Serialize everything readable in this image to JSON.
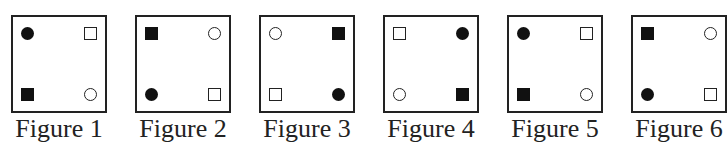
{
  "figures": [
    {
      "label": "Figure 1",
      "tl": "filled-circle",
      "tr": "open-square",
      "bl": "filled-square",
      "br": "open-circle"
    },
    {
      "label": "Figure 2",
      "tl": "filled-square",
      "tr": "open-circle",
      "bl": "filled-circle",
      "br": "open-square"
    },
    {
      "label": "Figure 3",
      "tl": "open-circle",
      "tr": "filled-square",
      "bl": "open-square",
      "br": "filled-circle"
    },
    {
      "label": "Figure 4",
      "tl": "open-square",
      "tr": "filled-circle",
      "bl": "open-circle",
      "br": "filled-square"
    },
    {
      "label": "Figure 5",
      "tl": "filled-circle",
      "tr": "open-square",
      "bl": "filled-square",
      "br": "open-circle"
    },
    {
      "label": "Figure 6",
      "tl": "filled-square",
      "tr": "open-circle",
      "bl": "filled-circle",
      "br": "open-square"
    }
  ],
  "colors": {
    "stroke": "#222222",
    "fill": "#111111",
    "background": "#ffffff"
  }
}
